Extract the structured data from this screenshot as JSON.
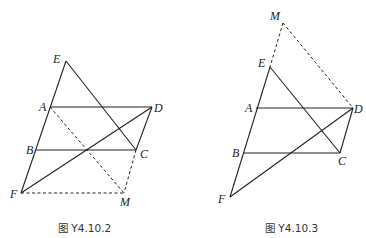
{
  "figures": [
    {
      "caption": "图 Y4.10.2",
      "points": {
        "E": [
          66,
          61
        ],
        "A": [
          50,
          107
        ],
        "D": [
          152,
          107
        ],
        "B": [
          36,
          150
        ],
        "C": [
          136,
          150
        ],
        "F": [
          21,
          193
        ],
        "M": [
          124,
          193
        ]
      },
      "labels": {
        "E": "E",
        "A": "A",
        "D": "D",
        "B": "B",
        "C": "C",
        "F": "F",
        "M": "M"
      },
      "solid_segments": [
        [
          "E",
          "F"
        ],
        [
          "A",
          "D"
        ],
        [
          "B",
          "C"
        ],
        [
          "D",
          "C"
        ],
        [
          "E",
          "C"
        ],
        [
          "F",
          "D"
        ]
      ],
      "dashed_segments": [
        [
          "A",
          "M"
        ],
        [
          "F",
          "M"
        ],
        [
          "C",
          "M"
        ]
      ]
    },
    {
      "caption": "图 Y4.10.3",
      "points": {
        "M": [
          283,
          23
        ],
        "E": [
          270,
          67
        ],
        "A": [
          256,
          108
        ],
        "D": [
          353,
          108
        ],
        "B": [
          243,
          153
        ],
        "C": [
          340,
          153
        ],
        "F": [
          230,
          197
        ]
      },
      "labels": {
        "E": "E",
        "A": "A",
        "D": "D",
        "B": "B",
        "C": "C",
        "F": "F",
        "M": "M"
      },
      "solid_segments": [
        [
          "E",
          "F"
        ],
        [
          "A",
          "D"
        ],
        [
          "B",
          "C"
        ],
        [
          "D",
          "C"
        ],
        [
          "E",
          "C"
        ],
        [
          "F",
          "D"
        ]
      ],
      "dashed_segments": [
        [
          "M",
          "E"
        ],
        [
          "M",
          "D"
        ]
      ]
    }
  ]
}
